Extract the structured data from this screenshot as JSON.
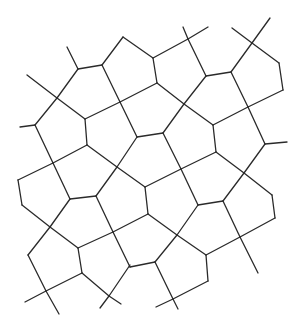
{
  "diagram": {
    "title": "",
    "stroke_color": "#2a2a2a",
    "background": "#ffffff",
    "width": 301,
    "height": 332,
    "edges": [
      [
        67,
        47,
        78,
        69
      ],
      [
        78,
        69,
        102,
        65
      ],
      [
        78,
        69,
        57,
        98
      ],
      [
        27,
        75,
        57,
        98
      ],
      [
        57,
        98,
        85,
        119
      ],
      [
        57,
        98,
        35,
        125
      ],
      [
        102,
        65,
        123,
        37
      ],
      [
        123,
        37,
        153,
        58
      ],
      [
        102,
        65,
        120,
        102
      ],
      [
        153,
        58,
        188,
        39
      ],
      [
        183,
        27,
        188,
        39
      ],
      [
        188,
        39,
        208,
        27
      ],
      [
        153,
        58,
        157,
        83
      ],
      [
        157,
        83,
        120,
        102
      ],
      [
        120,
        102,
        85,
        119
      ],
      [
        188,
        39,
        206,
        76
      ],
      [
        206,
        76,
        231,
        72
      ],
      [
        231,
        72,
        252,
        43
      ],
      [
        232,
        28,
        252,
        43
      ],
      [
        252,
        43,
        270,
        18
      ],
      [
        252,
        43,
        279,
        63
      ],
      [
        279,
        63,
        283,
        90
      ],
      [
        283,
        90,
        248,
        107
      ],
      [
        248,
        107,
        213,
        125
      ],
      [
        213,
        125,
        184,
        104
      ],
      [
        184,
        104,
        157,
        83
      ],
      [
        206,
        76,
        184,
        104
      ],
      [
        184,
        104,
        163,
        133
      ],
      [
        231,
        72,
        248,
        107
      ],
      [
        248,
        107,
        265,
        144
      ],
      [
        265,
        144,
        287,
        142
      ],
      [
        20,
        127,
        35,
        125
      ],
      [
        35,
        125,
        53,
        163
      ],
      [
        85,
        119,
        87,
        145
      ],
      [
        87,
        145,
        53,
        163
      ],
      [
        87,
        145,
        117,
        167
      ],
      [
        120,
        102,
        137,
        137
      ],
      [
        137,
        137,
        163,
        133
      ],
      [
        137,
        137,
        117,
        167
      ],
      [
        163,
        133,
        181,
        169
      ],
      [
        213,
        125,
        216,
        152
      ],
      [
        216,
        152,
        181,
        169
      ],
      [
        216,
        152,
        244,
        173
      ],
      [
        265,
        144,
        244,
        173
      ],
      [
        53,
        163,
        18,
        180
      ],
      [
        18,
        180,
        22,
        205
      ],
      [
        22,
        205,
        50,
        227
      ],
      [
        53,
        163,
        70,
        199
      ],
      [
        70,
        199,
        96,
        196
      ],
      [
        96,
        196,
        117,
        167
      ],
      [
        117,
        167,
        145,
        187
      ],
      [
        145,
        187,
        181,
        169
      ],
      [
        96,
        196,
        113,
        232
      ],
      [
        70,
        199,
        50,
        227
      ],
      [
        50,
        227,
        78,
        248
      ],
      [
        78,
        248,
        113,
        232
      ],
      [
        145,
        187,
        148,
        214
      ],
      [
        148,
        214,
        113,
        232
      ],
      [
        148,
        214,
        177,
        235
      ],
      [
        181,
        169,
        198,
        205
      ],
      [
        198,
        205,
        223,
        201
      ],
      [
        223,
        201,
        244,
        173
      ],
      [
        244,
        173,
        272,
        195
      ],
      [
        272,
        195,
        275,
        218
      ],
      [
        275,
        218,
        240,
        237
      ],
      [
        223,
        201,
        240,
        237
      ],
      [
        240,
        237,
        258,
        273
      ],
      [
        240,
        237,
        206,
        255
      ],
      [
        198,
        205,
        177,
        235
      ],
      [
        177,
        235,
        206,
        255
      ],
      [
        206,
        255,
        208,
        281
      ],
      [
        208,
        281,
        173,
        299
      ],
      [
        50,
        227,
        28,
        255
      ],
      [
        28,
        255,
        46,
        291
      ],
      [
        78,
        248,
        82,
        273
      ],
      [
        82,
        273,
        46,
        291
      ],
      [
        46,
        291,
        25,
        302
      ],
      [
        46,
        291,
        59,
        314
      ],
      [
        82,
        273,
        109,
        296
      ],
      [
        109,
        296,
        130,
        265
      ],
      [
        109,
        296,
        100,
        308
      ],
      [
        109,
        296,
        121,
        304
      ],
      [
        113,
        232,
        130,
        267
      ],
      [
        130,
        267,
        155,
        262
      ],
      [
        155,
        262,
        177,
        235
      ],
      [
        155,
        262,
        173,
        299
      ],
      [
        173,
        299,
        156,
        307
      ],
      [
        173,
        299,
        178,
        309
      ]
    ]
  }
}
